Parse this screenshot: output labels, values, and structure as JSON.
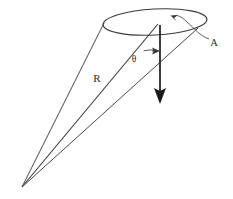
{
  "figure": {
    "background_color": "#ffffff",
    "line_color": "#3a3a3a",
    "axis_color": "#1a1a1a",
    "label_color": "#2b2b2b"
  },
  "labels": {
    "radius": "R",
    "angle": "θ",
    "area": "A"
  },
  "geometry": {
    "apex": {
      "x": 22,
      "y": 187
    },
    "cap_ellipse": {
      "cx": 155,
      "cy": 22,
      "rx": 52,
      "ry": 13,
      "rotation_deg": -3
    },
    "axis_arrow": {
      "x1": 160,
      "y1": 25,
      "x2": 160,
      "y2": 103
    },
    "slant_left_end": {
      "x": 104,
      "y": 23
    },
    "slant_center_end": {
      "x": 158,
      "y": 24
    },
    "slant_right_end": {
      "x": 198,
      "y": 28
    },
    "angle_arc_radius": 26,
    "leader_curve_from": {
      "x": 208,
      "y": 38
    },
    "leader_curve_to": {
      "x": 172,
      "y": 19
    }
  },
  "label_positions": {
    "radius": {
      "x": 97,
      "y": 82
    },
    "angle": {
      "x": 134,
      "y": 62
    },
    "area": {
      "x": 213,
      "y": 45
    }
  }
}
